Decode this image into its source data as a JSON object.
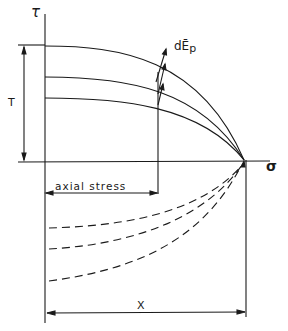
{
  "diagram": {
    "axes": {
      "vertical_label": "τ",
      "horizontal_label": "σ"
    },
    "labels": {
      "T": "T",
      "strain_increment": "dĒ",
      "strain_increment_sub": "p",
      "axial_stress": "axial stress",
      "X": "X"
    },
    "curves": {
      "solid_yield_curves": 3,
      "dashed_curves": 3
    }
  }
}
